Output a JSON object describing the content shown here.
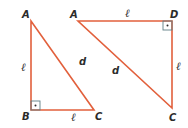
{
  "colors": {
    "line": "#e2603c",
    "right_angle_mark": "#5f7f86",
    "label": "#2b2b2b"
  },
  "figures": [
    {
      "name": "triangle-abc",
      "vertices": {
        "A": [
          31,
          21
        ],
        "B": [
          31,
          110
        ],
        "C": [
          94,
          110
        ]
      },
      "right_angle_at": "B",
      "labels": {
        "A": "A",
        "B": "B",
        "C": "C",
        "side_ab": "ℓ",
        "side_bc": "ℓ",
        "hypotenuse": "d"
      }
    },
    {
      "name": "triangle-adc",
      "vertices": {
        "A": [
          78,
          21
        ],
        "D": [
          172,
          21
        ],
        "C": [
          172,
          108
        ]
      },
      "right_angle_at": "D",
      "labels": {
        "A": "A",
        "D": "D",
        "C": "C",
        "side_ad": "ℓ",
        "side_dc": "ℓ",
        "hypotenuse": "d"
      }
    }
  ]
}
